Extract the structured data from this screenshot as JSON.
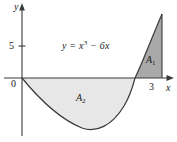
{
  "figure": {
    "background_color": "#ffffff",
    "width": 177,
    "height": 142
  },
  "axes": {
    "y_axis_label": "y",
    "x_axis_label": "x",
    "origin_label": "0",
    "y_ticks": [
      "5"
    ],
    "x_ticks": [
      "3"
    ],
    "axis_color": "#3a3a3a"
  },
  "curve": {
    "equation_text": "y = x",
    "equation_exponent": "3",
    "equation_rest": " − 6x",
    "color": "#3a3a3a"
  },
  "regions": [
    {
      "label": "A",
      "subscript": "1",
      "fill_color": "#a9a9a9",
      "description": "region above x-axis between curve and x = 3"
    },
    {
      "label": "A",
      "subscript": "2",
      "fill_color": "#e7e7e7",
      "description": "region below x-axis between x = 0 and the curve root"
    }
  ]
}
